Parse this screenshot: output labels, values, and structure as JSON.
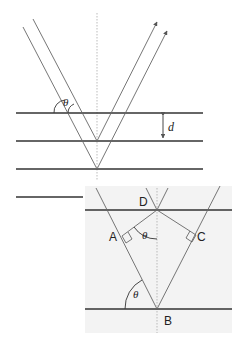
{
  "colors": {
    "line": "#333333",
    "ray": "#666666",
    "inset_bg": "#f3f3f3",
    "dashed": "#999999"
  },
  "top": {
    "angle_label": "θ",
    "spacing_label": "d"
  },
  "inset": {
    "point_labels": {
      "D": "D",
      "A": "A",
      "C": "C",
      "B": "B"
    },
    "angle_label_upper": "θ",
    "angle_label_lower": "θ"
  }
}
